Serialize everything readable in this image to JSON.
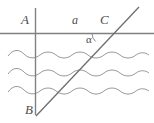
{
  "figure": {
    "background_color": "#ffffff",
    "line_color": "#808080",
    "wave_color": "#999999",
    "label_color": "#4d4d4d",
    "width": 154,
    "height": 123
  },
  "labels": {
    "point_a": "A",
    "point_b": "B",
    "point_c": "C",
    "segment_a": "a",
    "angle_alpha": "α"
  },
  "geometry": {
    "horizontal_line": {
      "x1": 0,
      "y1": 33.5,
      "x2": 154,
      "y2": 33.5
    },
    "vertical_line": {
      "x1": 35.5,
      "y1": 8,
      "x2": 35.5,
      "y2": 115
    },
    "diagonal_line": {
      "x1": 36,
      "y1": 116,
      "x2": 139,
      "y2": 7
    },
    "angle_arc": {
      "cx": 103,
      "cy": 33.5,
      "r": 11
    },
    "wave_lines": [
      {
        "y": 54,
        "x_start": 8,
        "x_end": 149
      },
      {
        "y": 72,
        "x_start": 8,
        "x_end": 149
      },
      {
        "y": 90,
        "x_start": 8,
        "x_end": 149
      }
    ]
  }
}
